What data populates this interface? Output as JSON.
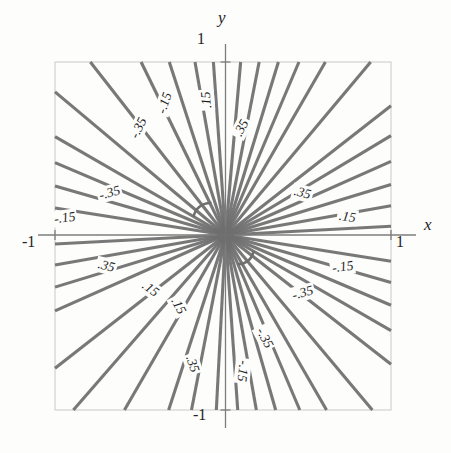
{
  "figure": {
    "kind": "contour-plot",
    "background_color": "#fdfdfc",
    "frame_color": "#c9c9c9",
    "axis_color": "#7d7d7d",
    "contour_color": "#6f6f6f",
    "text_color": "#222222"
  },
  "axes": {
    "x_label": "x",
    "y_label": "y",
    "x_ticks": [
      {
        "label": "-1",
        "value": -1
      },
      {
        "label": "1",
        "value": 1
      }
    ],
    "y_ticks": [
      {
        "label": "-1",
        "value": -1
      },
      {
        "label": "1",
        "value": 1
      }
    ]
  },
  "chart_data": {
    "type": "line",
    "title": "",
    "subtitle": "",
    "xlabel": "x",
    "ylabel": "y",
    "xlim": [
      -1,
      1
    ],
    "ylim": [
      -1,
      1
    ],
    "grid": false,
    "legend": "none",
    "plot_style": "contour lines through origin (level curves of a homogeneous degree-0 function)",
    "contour_levels": [
      -0.35,
      -0.15,
      0.15,
      0.35
    ],
    "level_labels": [
      "-.35",
      "-.15",
      ".15",
      ".35"
    ],
    "series": [
      {
        "name": "-.35",
        "angle_deg": 100,
        "value": -0.35
      },
      {
        "name": "-.15",
        "angle_deg": 85,
        "value": -0.15
      },
      {
        "name": ".15",
        "angle_deg": 73,
        "value": 0.15
      },
      {
        "name": ".35",
        "angle_deg": 60,
        "value": 0.35
      },
      {
        "name": ".35",
        "angle_deg": 24,
        "value": 0.35
      },
      {
        "name": ".15",
        "angle_deg": 10,
        "value": 0.15
      },
      {
        "name": "-.15",
        "angle_deg": -9,
        "value": -0.15
      },
      {
        "name": "-.35",
        "angle_deg": -23,
        "value": -0.35
      },
      {
        "name": "-.35",
        "angle_deg": -60,
        "value": -0.35
      },
      {
        "name": "-.15",
        "angle_deg": -74,
        "value": -0.15
      },
      {
        "name": ".15",
        "angle_deg": -86,
        "value": 0.15
      },
      {
        "name": ".35",
        "angle_deg": -101,
        "value": 0.35
      },
      {
        "name": ".35",
        "angle_deg": -156,
        "value": 0.35
      },
      {
        "name": ".15",
        "angle_deg": -170,
        "value": 0.15
      },
      {
        "name": "-.15",
        "angle_deg": 171,
        "value": -0.15
      },
      {
        "name": "-.35",
        "angle_deg": 157,
        "value": -0.35
      }
    ],
    "ray_angles_deg": [
      100,
      94,
      85,
      79,
      73,
      67,
      60,
      50,
      38,
      31,
      24,
      17,
      10,
      3,
      -9,
      -16,
      -23,
      -30,
      -38,
      -50,
      -60,
      -67,
      -74,
      -80,
      -86,
      -93,
      -101,
      -108,
      -120,
      -131,
      -142,
      -156,
      -163,
      -170,
      -177,
      171,
      164,
      157,
      150,
      140,
      128,
      116,
      108
    ]
  },
  "contour_labels": [
    {
      "id": "top-n35",
      "text": "-.35",
      "x": 126,
      "y": 120,
      "rotation": -64
    },
    {
      "id": "top-n15",
      "text": "-.15",
      "x": 152,
      "y": 95,
      "rotation": -72
    },
    {
      "id": "top-p15",
      "text": ".15",
      "x": 196,
      "y": 92,
      "rotation": -95
    },
    {
      "id": "top-p35",
      "text": ".35",
      "x": 231,
      "y": 120,
      "rotation": -62
    },
    {
      "id": "left-n35",
      "text": "-.35",
      "x": 97,
      "y": 185,
      "rotation": -15
    },
    {
      "id": "left-n15",
      "text": "-.15",
      "x": 52,
      "y": 210,
      "rotation": -8
    },
    {
      "id": "right-p35",
      "text": ".35",
      "x": 292,
      "y": 185,
      "rotation": 15
    },
    {
      "id": "right-p15",
      "text": ".15",
      "x": 337,
      "y": 209,
      "rotation": 8
    },
    {
      "id": "right-n15",
      "text": "-.15",
      "x": 330,
      "y": 259,
      "rotation": -8
    },
    {
      "id": "right-n35",
      "text": "-.35",
      "x": 290,
      "y": 285,
      "rotation": -15
    },
    {
      "id": "left-p35",
      "text": ".35",
      "x": 96,
      "y": 258,
      "rotation": 14
    },
    {
      "id": "left-p15",
      "text": ".15",
      "x": 140,
      "y": 281,
      "rotation": 36
    },
    {
      "id": "bot-p15",
      "text": ".15",
      "x": 168,
      "y": 298,
      "rotation": 62
    },
    {
      "id": "bot-p35",
      "text": ".35",
      "x": 182,
      "y": 356,
      "rotation": 72
    },
    {
      "id": "bot-n15",
      "text": "-.15",
      "x": 230,
      "y": 363,
      "rotation": 96
    },
    {
      "id": "bot-n35",
      "text": "-.35",
      "x": 252,
      "y": 330,
      "rotation": 62
    }
  ]
}
